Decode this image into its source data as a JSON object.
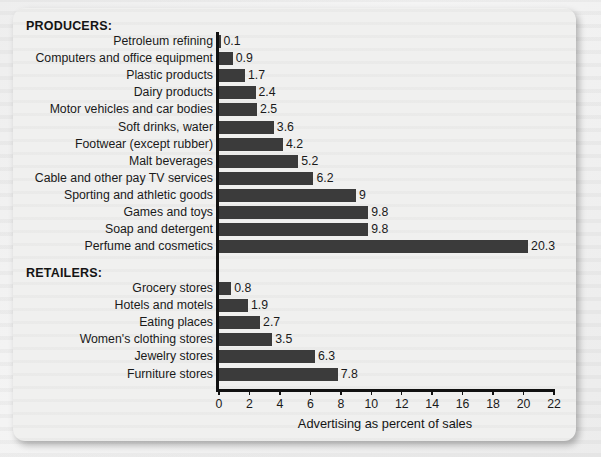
{
  "panel": {
    "sections": [
      {
        "id": "producers",
        "heading": "PRODUCERS:"
      },
      {
        "id": "retailers",
        "heading": "RETAILERS:"
      }
    ]
  },
  "chart_data": {
    "type": "bar",
    "orientation": "horizontal",
    "title": "",
    "xlabel": "Advertising as percent of sales",
    "ylabel": "",
    "xlim": [
      0,
      22
    ],
    "xticks": [
      0,
      2,
      4,
      6,
      8,
      10,
      12,
      14,
      16,
      18,
      20,
      22
    ],
    "grid": false,
    "legend": null,
    "bar_color": "#3b3b3b",
    "groups": [
      {
        "name": "PRODUCERS:",
        "categories": [
          "Petroleum refining",
          "Computers and office equipment",
          "Plastic products",
          "Dairy products",
          "Motor vehicles and car bodies",
          "Soft drinks, water",
          "Footwear (except rubber)",
          "Malt beverages",
          "Cable and other pay TV services",
          "Sporting and athletic goods",
          "Games and toys",
          "Soap and detergent",
          "Perfume and cosmetics"
        ],
        "values": [
          0.1,
          0.9,
          1.7,
          2.4,
          2.5,
          3.6,
          4.2,
          5.2,
          6.2,
          9,
          9.8,
          9.8,
          20.3
        ],
        "labels": [
          "0.1",
          "0.9",
          "1.7",
          "2.4",
          "2.5",
          "3.6",
          "4.2",
          "5.2",
          "6.2",
          "9",
          "9.8",
          "9.8",
          "20.3"
        ]
      },
      {
        "name": "RETAILERS:",
        "categories": [
          "Grocery stores",
          "Hotels and motels",
          "Eating places",
          "Women's clothing stores",
          "Jewelry stores",
          "Furniture stores"
        ],
        "values": [
          0.8,
          1.9,
          2.7,
          3.5,
          6.3,
          7.8
        ],
        "labels": [
          "0.8",
          "1.9",
          "2.7",
          "3.5",
          "6.3",
          "7.8"
        ]
      }
    ]
  }
}
